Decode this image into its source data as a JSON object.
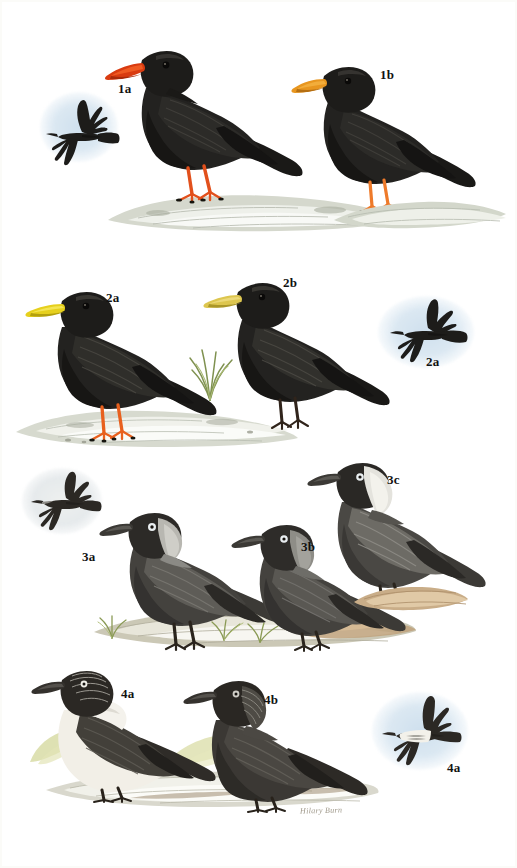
{
  "plate": {
    "title": "Choughs and Jackdaws",
    "artist_signature": "Hilary Burn",
    "background_color": "#ffffff",
    "width": 517,
    "height": 868
  },
  "palette": {
    "chough_black": "#1b1a18",
    "chough_black_light": "#3a3936",
    "red_bill": "#d93b10",
    "orange_bill": "#e8961f",
    "yellow_bill": "#e6d01d",
    "red_legs": "#e2501c",
    "orange_legs": "#ee7a2a",
    "jackdaw_body": "#4a4a47",
    "jackdaw_nape": "#9a9a96",
    "jackdaw_nape_pale": "#d8d8d2",
    "jackdaw_eye": "#e7edf0",
    "daurian_white": "#f4f2ec",
    "sky_wash": "#cfe0ee",
    "rock_grey": "#c9ccc2",
    "rock_white": "#f2f2ee",
    "earth_brown": "#b09370",
    "grass_green": "#9aa96a",
    "label_color": "#121212",
    "signature_color": "#8d8574"
  },
  "rows": [
    {
      "id": "row-1",
      "species": "Red-billed Chough",
      "figures": [
        {
          "id": "1a-flight",
          "label": "1a",
          "pose": "flight",
          "label_x": 118,
          "label_y": 82
        },
        {
          "id": "1a-perched",
          "label": "1a",
          "pose": "perched",
          "bill": "red",
          "legs": "red"
        },
        {
          "id": "1b-perched",
          "label": "1b",
          "pose": "perched",
          "bill": "orange",
          "legs": "orange",
          "label_x": 380,
          "label_y": 68
        }
      ]
    },
    {
      "id": "row-2",
      "species": "Alpine Chough",
      "figures": [
        {
          "id": "2a-perched",
          "label": "2a",
          "pose": "perched",
          "bill": "yellow",
          "legs": "orange",
          "label_x": 106,
          "label_y": 291
        },
        {
          "id": "2b-perched",
          "label": "2b",
          "pose": "perched",
          "bill": "yellow-pale",
          "legs": "dark",
          "label_x": 283,
          "label_y": 276
        },
        {
          "id": "2a-flight",
          "label": "2a",
          "pose": "flight",
          "label_x": 426,
          "label_y": 355
        }
      ]
    },
    {
      "id": "row-3",
      "species": "Western Jackdaw",
      "figures": [
        {
          "id": "3a-flight",
          "label": "3a",
          "pose": "flight",
          "label_x": 82,
          "label_y": 550
        },
        {
          "id": "3a-perched",
          "label": "3a",
          "pose": "perched",
          "nape": "grey"
        },
        {
          "id": "3b-perched",
          "label": "3b",
          "pose": "perched",
          "nape": "dark-grey",
          "label_x": 301,
          "label_y": 540
        },
        {
          "id": "3c-perched",
          "label": "3c",
          "pose": "perched",
          "nape": "white",
          "label_x": 387,
          "label_y": 473
        }
      ]
    },
    {
      "id": "row-4",
      "species": "Daurian Jackdaw",
      "figures": [
        {
          "id": "4a-perched",
          "label": "4a",
          "pose": "perched",
          "morph": "pied",
          "label_x": 121,
          "label_y": 687
        },
        {
          "id": "4b-perched",
          "label": "4b",
          "pose": "perched",
          "morph": "dark",
          "label_x": 264,
          "label_y": 693
        },
        {
          "id": "4a-flight",
          "label": "4a",
          "pose": "flight",
          "morph": "pied",
          "label_x": 447,
          "label_y": 761
        }
      ]
    }
  ],
  "labels": {
    "r1_flight": "1a",
    "r1_b": "1b",
    "r2_a": "2a",
    "r2_b": "2b",
    "r2_flight": "2a",
    "r3_flight": "3a",
    "r3_b": "3b",
    "r3_c": "3c",
    "r4_a": "4a",
    "r4_b": "4b",
    "r4_flight": "4a",
    "signature": "Hilary Burn"
  }
}
